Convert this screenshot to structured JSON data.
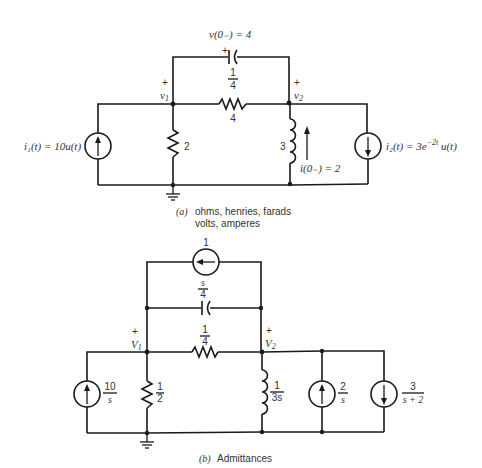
{
  "circuit_a": {
    "caption_tag": "(a)",
    "caption_line1": "ohms, henries, farads",
    "caption_line2": "volts, amperes",
    "node1_label": "v",
    "node1_sub": "1",
    "node2_label": "v",
    "node2_sub": "2",
    "plus": "+",
    "capacitor": {
      "value_num": "1",
      "value_den": "4",
      "initial_condition": "v(0₋) = 4",
      "polarity": "+"
    },
    "series_resistor": {
      "value": "4"
    },
    "shunt_resistor": {
      "value": "2"
    },
    "inductor": {
      "value": "3",
      "initial_condition": "i(0₋) = 2"
    },
    "source_left": {
      "label": "i₁(t) = 10u(t)",
      "direction": "up"
    },
    "source_right": {
      "label_prefix": "i₂(t) = 3e",
      "exponent": "−2t",
      "label_suffix": " u(t)",
      "direction": "down"
    }
  },
  "circuit_b": {
    "caption_tag": "(b)",
    "caption": "Admittances",
    "node1_label": "V",
    "node1_sub": "1",
    "node2_label": "V",
    "node2_sub": "2",
    "plus": "+",
    "top_source": {
      "value": "1",
      "direction": "left"
    },
    "capacitor": {
      "value_num": "s",
      "value_den": "4"
    },
    "series_resistor": {
      "value_num": "1",
      "value_den": "4"
    },
    "shunt_resistor": {
      "value_num": "1",
      "value_den": "2"
    },
    "inductor": {
      "value_num": "1",
      "value_den": "3s"
    },
    "source_left": {
      "value_num": "10",
      "value_den": "s",
      "direction": "up"
    },
    "source_mid": {
      "value_num": "2",
      "value_den": "s",
      "direction": "up"
    },
    "source_right": {
      "value_num": "3",
      "value_den": "s + 2",
      "direction": "down"
    }
  }
}
